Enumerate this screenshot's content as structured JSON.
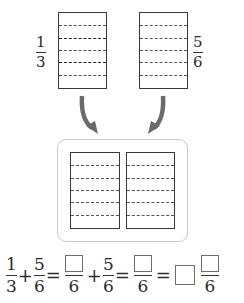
{
  "top_left": {
    "label": {
      "numerator": "1",
      "denominator": "3"
    },
    "divisions": 6,
    "bold_lines": [
      2,
      4
    ]
  },
  "top_right": {
    "label": {
      "numerator": "5",
      "denominator": "6"
    },
    "divisions": 6
  },
  "bottom_panel": {
    "left_strip_divisions": 6,
    "right_strip_divisions": 6
  },
  "arrows": {
    "color": "#6b6b6b"
  },
  "equation": {
    "term1": {
      "numerator": "1",
      "denominator": "3"
    },
    "plus1": "+",
    "term2": {
      "numerator": "5",
      "denominator": "6"
    },
    "eq1": "=",
    "blank_frac1": {
      "numerator": "",
      "denominator": "6"
    },
    "plus2": "+",
    "term3": {
      "numerator": "5",
      "denominator": "6"
    },
    "eq2": "=",
    "blank_frac2": {
      "numerator": "",
      "denominator": "6"
    },
    "eq3": "=",
    "mixed": {
      "whole": "",
      "numerator": "",
      "denominator": "6"
    }
  }
}
